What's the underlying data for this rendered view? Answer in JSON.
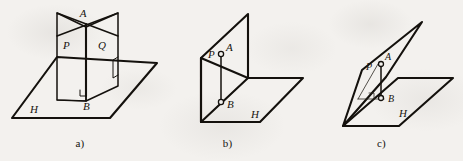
{
  "figure": {
    "background_color": "#f3f1ee",
    "ink_color": "#14110d",
    "panel_count": 3
  },
  "panels": [
    {
      "id": "a",
      "caption": "a)",
      "description": "Two vertical half-planes P and Q intersecting along line AB, standing perpendicular on horizontal plane H; right-angle mark at B.",
      "labels": {
        "apex": "A",
        "foot": "B",
        "plane_left": "P",
        "plane_right": "Q",
        "ground_plane": "H"
      },
      "features": {
        "right_angle_at_foot": true,
        "point_markers": false,
        "planes": [
          "P",
          "Q",
          "H"
        ]
      }
    },
    {
      "id": "b",
      "caption": "b)",
      "description": "Single vertical plane P meeting horizontal plane H at right angle; segment AB drawn in plane P with open circle markers at A and B.",
      "labels": {
        "apex": "A",
        "foot": "B",
        "plane_left": "P",
        "ground_plane": "H"
      },
      "features": {
        "right_angle_at_foot": false,
        "point_markers": true,
        "planes": [
          "P",
          "H"
        ]
      }
    },
    {
      "id": "c",
      "caption": "c)",
      "description": "Slanted narrow plane P cutting horizontal plane H; segment AB with open circle markers, triangle drawn to the intersection line and right-angle mark at B.",
      "labels": {
        "apex": "A",
        "foot": "B",
        "plane_left": "P",
        "ground_plane": "H"
      },
      "features": {
        "right_angle_at_foot": true,
        "point_markers": true,
        "planes": [
          "P",
          "H"
        ]
      }
    }
  ]
}
